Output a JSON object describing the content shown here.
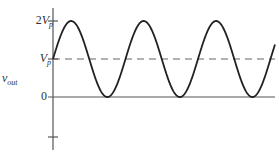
{
  "diagram": {
    "title": "",
    "y_axis_label": {
      "main": "v",
      "subscript": "out"
    },
    "ticks": [
      {
        "name": "two-vp",
        "coef": "2",
        "var": "V",
        "sub": "p",
        "level": 2
      },
      {
        "name": "vp",
        "coef": "",
        "var": "V",
        "sub": "p",
        "level": 1
      },
      {
        "name": "zero",
        "text": "0",
        "level": 0
      }
    ],
    "reference_line": {
      "style": "dashed",
      "level": "V_p"
    },
    "waveform": {
      "type": "sinusoid",
      "offset": "V_p",
      "amplitude": "V_p",
      "min": "0",
      "max": "2V_p",
      "cycles_shown": 3,
      "start_phase": "rising from V_p"
    },
    "colors": {
      "curve": "#222222",
      "axis": "#555555",
      "dashed": "#666666",
      "text": "#333333"
    }
  }
}
